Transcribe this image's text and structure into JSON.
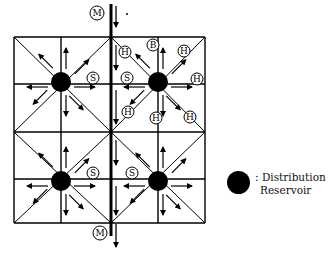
{
  "diagram": {
    "grid": {
      "left": 14,
      "top": 37,
      "right": 205,
      "bottom": 223,
      "cols_x": [
        14,
        61,
        111,
        158,
        205
      ],
      "rows_y": [
        37,
        84,
        132,
        179,
        223
      ]
    },
    "main_line": {
      "x": 111,
      "label": "M",
      "top_label": "M",
      "bottom_label": "M"
    },
    "reservoirs": [
      {
        "id": "r1",
        "cx": 61,
        "cy": 82
      },
      {
        "id": "r2",
        "cx": 158,
        "cy": 82
      },
      {
        "id": "r3",
        "cx": 61,
        "cy": 181
      },
      {
        "id": "r4",
        "cx": 158,
        "cy": 181
      }
    ],
    "labels": [
      {
        "text": "S",
        "x": 93,
        "y": 78
      },
      {
        "text": "S",
        "x": 127,
        "y": 78
      },
      {
        "text": "H",
        "x": 125,
        "y": 52
      },
      {
        "text": "B",
        "x": 153,
        "y": 45
      },
      {
        "text": "H",
        "x": 184,
        "y": 51
      },
      {
        "text": "H",
        "x": 197,
        "y": 79
      },
      {
        "text": "H",
        "x": 128,
        "y": 112
      },
      {
        "text": "H",
        "x": 156,
        "y": 118
      },
      {
        "text": "H",
        "x": 190,
        "y": 117
      },
      {
        "text": "S",
        "x": 93,
        "y": 173
      },
      {
        "text": "S",
        "x": 132,
        "y": 173
      }
    ],
    "colors": {
      "line": "#000000",
      "background": "#ffffff"
    }
  },
  "legend": {
    "symbol": "filled-circle",
    "label_line1": ": Distribution",
    "label_line2": "Reservoir"
  }
}
